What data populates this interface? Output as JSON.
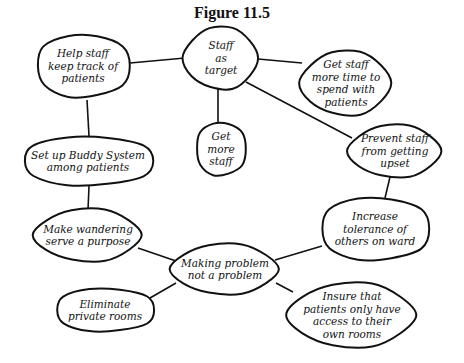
{
  "title": "Figure 11.5",
  "nodes": [
    {
      "id": "staff-as-target",
      "label": "Staff\nas\ntarget",
      "cx": 221,
      "cy": 58,
      "rx": 37,
      "ry": 31
    },
    {
      "id": "help-staff-keep-track",
      "label": "Help staff\nkeep track of\npatients",
      "cx": 83,
      "cy": 66,
      "rx": 47,
      "ry": 32
    },
    {
      "id": "get-staff-more-time",
      "label": "Get staff\nmore time to\nspend with\npatients",
      "cx": 346,
      "cy": 83,
      "rx": 45,
      "ry": 32
    },
    {
      "id": "get-more-staff",
      "label": "Get\nmore\nstaff",
      "cx": 221,
      "cy": 149,
      "rx": 25,
      "ry": 27
    },
    {
      "id": "prevent-staff-upset",
      "label": "Prevent staff\nfrom getting\nupset",
      "cx": 395,
      "cy": 151,
      "rx": 46,
      "ry": 26
    },
    {
      "id": "buddy-system",
      "label": "Set up Buddy System\namong patients",
      "cx": 88,
      "cy": 161,
      "rx": 66,
      "ry": 25
    },
    {
      "id": "make-wandering-purpose",
      "label": "Make wandering\nserve a purpose",
      "cx": 88,
      "cy": 235,
      "rx": 53,
      "ry": 26
    },
    {
      "id": "increase-tolerance",
      "label": "Increase\ntolerance of\nothers on ward",
      "cx": 375,
      "cy": 229,
      "rx": 55,
      "ry": 32
    },
    {
      "id": "making-problem-not-problem",
      "label": "Making problem\nnot a  problem",
      "cx": 225,
      "cy": 269,
      "rx": 53,
      "ry": 25
    },
    {
      "id": "eliminate-private-rooms",
      "label": "Eliminate\nprivate rooms",
      "cx": 105,
      "cy": 310,
      "rx": 50,
      "ry": 22
    },
    {
      "id": "insure-access-own-rooms",
      "label": "Insure that\npatients only have\naccess to their\nown rooms",
      "cx": 352,
      "cy": 315,
      "rx": 63,
      "ry": 32
    }
  ],
  "edges": [
    {
      "from": "staff-as-target",
      "to": "help-staff-keep-track",
      "x1": 185,
      "y1": 58,
      "x2": 130,
      "y2": 63
    },
    {
      "from": "staff-as-target",
      "to": "get-staff-more-time",
      "x1": 258,
      "y1": 59,
      "x2": 302,
      "y2": 63
    },
    {
      "from": "staff-as-target",
      "to": "get-more-staff",
      "x1": 218,
      "y1": 89,
      "x2": 218,
      "y2": 123
    },
    {
      "from": "staff-as-target",
      "to": "prevent-staff-upset",
      "x1": 246,
      "y1": 82,
      "x2": 352,
      "y2": 138
    },
    {
      "from": "help-staff-keep-track",
      "to": "buddy-system",
      "x1": 87,
      "y1": 100,
      "x2": 89,
      "y2": 136
    },
    {
      "from": "buddy-system",
      "to": "make-wandering-purpose",
      "x1": 89,
      "y1": 186,
      "x2": 88,
      "y2": 210
    },
    {
      "from": "prevent-staff-upset",
      "to": "increase-tolerance",
      "x1": 390,
      "y1": 177,
      "x2": 385,
      "y2": 198
    },
    {
      "from": "make-wandering-purpose",
      "to": "making-problem-not-problem",
      "x1": 138,
      "y1": 248,
      "x2": 176,
      "y2: ": 0,
      "y2": 261
    },
    {
      "from": "increase-tolerance",
      "to": "making-problem-not-problem",
      "x1": 322,
      "y1": 246,
      "x2": 275,
      "y2": 260
    },
    {
      "from": "making-problem-not-problem",
      "to": "eliminate-private-rooms",
      "x1": 176,
      "y1": 283,
      "x2": 150,
      "y2": 298
    },
    {
      "from": "making-problem-not-problem",
      "to": "insure-access-own-rooms",
      "x1": 276,
      "y1": 283,
      "x2": 293,
      "y2": 292
    }
  ]
}
